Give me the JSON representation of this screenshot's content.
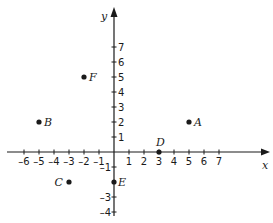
{
  "diagram": {
    "type": "coordinate-plane",
    "origin_px": [
      114,
      152
    ],
    "unit_px": 15,
    "axes": {
      "x": {
        "label": "x",
        "ticks": [
          -6,
          -5,
          -4,
          -3,
          -2,
          -1,
          1,
          2,
          3,
          4,
          5,
          6,
          7
        ]
      },
      "y": {
        "label": "y",
        "ticks": [
          -4,
          -3,
          -1,
          1,
          2,
          3,
          4,
          5,
          6,
          7
        ]
      }
    },
    "points": [
      {
        "name": "A",
        "x": 5,
        "y": 2
      },
      {
        "name": "B",
        "x": -5,
        "y": 2
      },
      {
        "name": "C",
        "x": -3,
        "y": -2
      },
      {
        "name": "D",
        "x": 3,
        "y": 0
      },
      {
        "name": "E",
        "x": 0,
        "y": -2
      },
      {
        "name": "F",
        "x": -2,
        "y": 5
      }
    ],
    "colors": {
      "ink": "#1a1a1a",
      "background": "#ffffff"
    }
  }
}
